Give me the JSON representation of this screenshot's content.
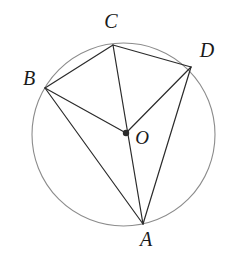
{
  "figure": {
    "background_color": "#ffffff",
    "stroke_color": "#2b2b2b",
    "circle_color": "#8c8c8c",
    "label_color": "#1a1a1a"
  },
  "circle": {
    "name": "circumscribed-circle",
    "cx": 123.5,
    "cy": 134.5,
    "r": 91.5,
    "stroke_width": 1.1
  },
  "center": {
    "name": "O",
    "x": 126,
    "y": 133,
    "dot_radius": 3.2,
    "label": "O",
    "label_x": 142,
    "label_y": 140,
    "label_size": 19
  },
  "points": [
    {
      "name": "A",
      "label": "A",
      "x": 143,
      "y": 224,
      "label_x": 146,
      "label_y": 241,
      "label_size": 20
    },
    {
      "name": "B",
      "label": "B",
      "x": 45,
      "y": 88,
      "label_x": 29,
      "label_y": 80,
      "label_size": 20
    },
    {
      "name": "C",
      "label": "C",
      "x": 113,
      "y": 45,
      "label_x": 111,
      "label_y": 23,
      "label_size": 20
    },
    {
      "name": "D",
      "label": "D",
      "x": 191,
      "y": 67,
      "label_x": 207,
      "label_y": 52,
      "label_size": 20
    }
  ],
  "segments": [
    {
      "name": "chord-BC",
      "from": "B",
      "to": "C",
      "x1": 45,
      "y1": 88,
      "x2": 113,
      "y2": 45
    },
    {
      "name": "chord-CD",
      "from": "C",
      "to": "D",
      "x1": 113,
      "y1": 45,
      "x2": 191,
      "y2": 67
    },
    {
      "name": "radius-BO",
      "from": "B",
      "to": "O",
      "x1": 45,
      "y1": 88,
      "x2": 126,
      "y2": 133
    },
    {
      "name": "radius-DO",
      "from": "D",
      "to": "O",
      "x1": 191,
      "y1": 67,
      "x2": 126,
      "y2": 133
    },
    {
      "name": "diameter-CA",
      "from": "C",
      "to": "A",
      "x1": 113,
      "y1": 45,
      "x2": 143,
      "y2": 224
    },
    {
      "name": "chord-BA",
      "from": "B",
      "to": "A",
      "x1": 45,
      "y1": 88,
      "x2": 143,
      "y2": 224
    },
    {
      "name": "chord-DA",
      "from": "D",
      "to": "A",
      "x1": 191,
      "y1": 67,
      "x2": 143,
      "y2": 224
    }
  ],
  "segment_stroke_width": 1.2
}
